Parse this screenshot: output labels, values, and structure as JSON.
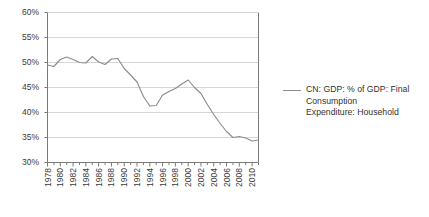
{
  "chart_data": {
    "type": "line",
    "title": "",
    "xlabel": "",
    "ylabel": "",
    "ylim": [
      30,
      60
    ],
    "ytick_step": 5,
    "grid": true,
    "legend_position": "right",
    "series": [
      {
        "name": "CN: GDP: % of GDP: Final Consumption Expenditure: Household",
        "color": "#8c8c8c",
        "x": [
          1978,
          1979,
          1980,
          1981,
          1982,
          1983,
          1984,
          1985,
          1986,
          1987,
          1988,
          1989,
          1990,
          1991,
          1992,
          1993,
          1994,
          1995,
          1996,
          1997,
          1998,
          1999,
          2000,
          2001,
          2002,
          2003,
          2004,
          2005,
          2006,
          2007,
          2008,
          2009,
          2010,
          2011
        ],
        "values": [
          49.5,
          49.2,
          50.6,
          51.1,
          50.6,
          50.0,
          49.9,
          51.2,
          50.1,
          49.6,
          50.7,
          50.8,
          48.8,
          47.5,
          46.1,
          43.2,
          41.3,
          41.4,
          43.5,
          44.2,
          44.8,
          45.7,
          46.5,
          45.0,
          43.8,
          41.6,
          39.6,
          37.8,
          36.2,
          35.0,
          35.2,
          34.9,
          34.3,
          34.5
        ]
      }
    ],
    "yticks": [
      {
        "value": 60,
        "label": "60%"
      },
      {
        "value": 55,
        "label": "55%"
      },
      {
        "value": 50,
        "label": "50%"
      },
      {
        "value": 45,
        "label": "45%"
      },
      {
        "value": 40,
        "label": "40%"
      },
      {
        "value": 35,
        "label": "35%"
      },
      {
        "value": 30,
        "label": "30%"
      }
    ],
    "xticks": [
      {
        "value": 1978,
        "label": "1978"
      },
      {
        "value": 1980,
        "label": "1980"
      },
      {
        "value": 1982,
        "label": "1982"
      },
      {
        "value": 1984,
        "label": "1984"
      },
      {
        "value": 1986,
        "label": "1986"
      },
      {
        "value": 1988,
        "label": "1988"
      },
      {
        "value": 1990,
        "label": "1990"
      },
      {
        "value": 1992,
        "label": "1992"
      },
      {
        "value": 1994,
        "label": "1994"
      },
      {
        "value": 1996,
        "label": "1996"
      },
      {
        "value": 1998,
        "label": "1998"
      },
      {
        "value": 2000,
        "label": "2000"
      },
      {
        "value": 2002,
        "label": "2002"
      },
      {
        "value": 2004,
        "label": "2004"
      },
      {
        "value": 2006,
        "label": "2006"
      },
      {
        "value": 2008,
        "label": "2008"
      },
      {
        "value": 2010,
        "label": "2010"
      }
    ],
    "xtick_minor_start": 1978,
    "xtick_minor_end": 2011
  },
  "legend": {
    "entries": [
      {
        "label_lines": [
          "CN: GDP: % of GDP: Final",
          "Consumption",
          "Expenditure: Household"
        ],
        "color": "#8c8c8c"
      }
    ],
    "line1": "CN: GDP: % of GDP: Final",
    "line2": "Consumption",
    "line3": "Expenditure: Household"
  },
  "style": {
    "axis_color": "#7a7a7a",
    "grid_color": "#d6d6d6",
    "line_color": "#8c8c8c",
    "text_color": "#3a3a3a",
    "background": "#ffffff"
  }
}
